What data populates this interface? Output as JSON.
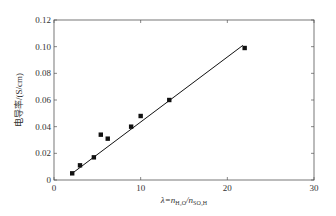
{
  "chart_data": {
    "type": "scatter",
    "title": "",
    "xlabel": "λ=n_H2O/n_SO3H",
    "xlabel_parts": {
      "main": "λ=n",
      "sub1": "H₂O",
      "slash": "/n",
      "sub2": "SO₃H"
    },
    "ylabel": "电导率/(S/cm)",
    "xlim": [
      0,
      30
    ],
    "ylim": [
      0,
      0.12
    ],
    "xticks": [
      0,
      10,
      20,
      30
    ],
    "yticks": [
      0,
      0.02,
      0.04,
      0.06,
      0.08,
      0.1,
      0.12
    ],
    "xtick_labels": [
      "0",
      "10",
      "20",
      "30"
    ],
    "ytick_labels": [
      "0",
      "0.02",
      "0.04",
      "0.06",
      "0.08",
      "0.10",
      "0.12"
    ],
    "grid": false,
    "legend": null,
    "series": [
      {
        "name": "measured",
        "marker": "square",
        "x": [
          2.1,
          3.0,
          4.6,
          5.4,
          6.2,
          8.9,
          10.0,
          13.3,
          22.0
        ],
        "y": [
          0.005,
          0.011,
          0.017,
          0.034,
          0.031,
          0.04,
          0.048,
          0.06,
          0.099
        ]
      },
      {
        "name": "linear fit",
        "type": "line",
        "x": [
          1.9,
          21.8
        ],
        "y": [
          0.004,
          0.101
        ]
      }
    ]
  },
  "colors": {
    "axis": "#555555",
    "marker": "#111111",
    "line": "#111111"
  }
}
